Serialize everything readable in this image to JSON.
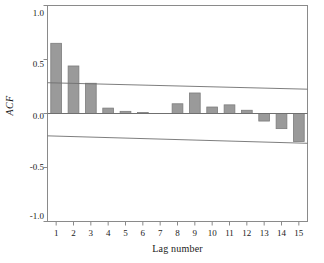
{
  "chart_data": {
    "type": "bar",
    "title": "",
    "subtitle": "",
    "xlabel": "Lag number",
    "ylabel": "ACF",
    "categories": [
      "1",
      "2",
      "3",
      "4",
      "5",
      "6",
      "7",
      "8",
      "9",
      "10",
      "11",
      "12",
      "13",
      "14",
      "15"
    ],
    "values": [
      0.65,
      0.44,
      0.28,
      0.05,
      0.02,
      0.01,
      0.0,
      0.09,
      0.19,
      0.06,
      0.08,
      0.03,
      -0.07,
      -0.14,
      -0.26
    ],
    "series": [
      {
        "name": "ACF",
        "values": [
          0.65,
          0.44,
          0.28,
          0.05,
          0.02,
          0.01,
          0.0,
          0.09,
          0.19,
          0.06,
          0.08,
          0.03,
          -0.07,
          -0.14,
          -0.26
        ]
      }
    ],
    "ylim": [
      -1.0,
      1.0
    ],
    "yticks": [
      1.0,
      0.5,
      0.0,
      -0.5,
      -1.0
    ],
    "ytick_labels": [
      "1.0",
      "0.5",
      "0.0",
      "-0.5",
      "-1.0"
    ],
    "xlim": [
      0.5,
      15.5
    ],
    "xticks": [
      1,
      2,
      3,
      4,
      5,
      6,
      7,
      8,
      9,
      10,
      11,
      12,
      13,
      14,
      15
    ],
    "grid": false,
    "legend": "none",
    "zero_line": 0.0,
    "confidence_bands": {
      "upper": {
        "start": 0.285,
        "end": 0.225
      },
      "lower": {
        "start": -0.207,
        "end": -0.276
      }
    },
    "colors": {
      "bar_fill": "#9a9a9a",
      "bar_stroke": "#7d7d7d",
      "axis": "#8a8a8a",
      "band_line": "#6f6f6f",
      "zero_line": "#6f6f6f",
      "background": "#ffffff",
      "text": "#1a1a1a"
    }
  }
}
